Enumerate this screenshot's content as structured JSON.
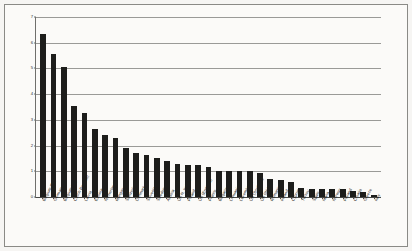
{
  "chart_data": {
    "type": "bar",
    "title": "",
    "subtitle": "",
    "xlabel": "",
    "ylabel": "",
    "ylim": [
      0,
      7
    ],
    "yticks": [
      0,
      1,
      2,
      3,
      4,
      5,
      6,
      7
    ],
    "ytick_labels": [
      "0",
      "1",
      "2",
      "3",
      "4",
      "5",
      "6",
      "7"
    ],
    "grid": true,
    "grid_axis": "y",
    "legend": false,
    "orientation": "vertical",
    "bar_color": "#1d1d1b",
    "categories": [
      "Belgium (Fr.)",
      "Germany",
      "Belgium (Fl.)",
      "Czech Republic",
      "Latvia",
      "Estonia",
      "Netherlands",
      "Hungary",
      "Switzerland",
      "Denmark",
      "Slovenia",
      "Sweden",
      "Austria",
      "UK N. Ireland",
      "Poland",
      "UK (England)",
      "France",
      "Bulgaria",
      "Lithuania",
      "Luxembourg",
      "UK (Scotland)",
      "UK (Wales)",
      "Romania",
      "Ireland",
      "Cyprus",
      "Turkey",
      "Spain",
      "Malta",
      "Norway",
      "Finland",
      "Croatia",
      "Greece",
      "Italy"
    ],
    "values": [
      6.35,
      5.55,
      5.05,
      3.55,
      3.25,
      2.65,
      2.4,
      2.3,
      1.9,
      1.7,
      1.65,
      1.5,
      1.4,
      1.3,
      1.25,
      1.25,
      1.15,
      1.0,
      1.0,
      1.0,
      1.0,
      0.95,
      0.7,
      0.65,
      0.6,
      0.35,
      0.3,
      0.3,
      0.3,
      0.3,
      0.25,
      0.2,
      0.08
    ]
  }
}
